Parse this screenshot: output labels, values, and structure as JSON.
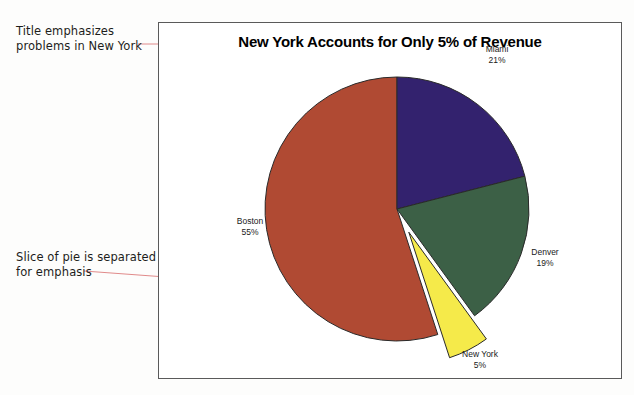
{
  "annotations": [
    {
      "id": "title-note",
      "text": "Title emphasizes\nproblems in New York"
    },
    {
      "id": "slice-note",
      "text": "Slice of pie is separated\nfor emphasis"
    }
  ],
  "leader_line_color": "#e08a8a",
  "chart": {
    "title": "New York Accounts for Only 5% of Revenue",
    "frame_border_color": "#5a5a5a"
  },
  "chart_data": {
    "type": "pie",
    "title": "New York Accounts for Only 5% of Revenue",
    "xlabel": "",
    "ylabel": "",
    "categories": [
      "Boston",
      "Miami",
      "Denver",
      "New York"
    ],
    "values": [
      55,
      21,
      19,
      5
    ],
    "value_suffix": "%",
    "colors": [
      "#b04a33",
      "#33226e",
      "#3c6046",
      "#f5ea4a"
    ],
    "slices": [
      {
        "name": "Boston",
        "value": 55,
        "label": "Boston",
        "value_label": "55%",
        "color": "#b04a33",
        "exploded": false
      },
      {
        "name": "Miami",
        "value": 21,
        "label": "Miami",
        "value_label": "21%",
        "color": "#33226e",
        "exploded": false
      },
      {
        "name": "Denver",
        "value": 19,
        "label": "Denver",
        "value_label": "19%",
        "color": "#3c6046",
        "exploded": false
      },
      {
        "name": "New York",
        "value": 5,
        "label": "New York",
        "value_label": "5%",
        "color": "#f5ea4a",
        "exploded": true
      }
    ],
    "legend": "none",
    "grid": false,
    "start_angle_deg": 0,
    "direction": "clockwise",
    "total": 100
  }
}
